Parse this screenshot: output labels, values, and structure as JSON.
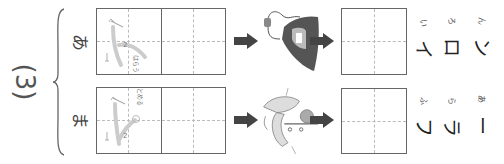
{
  "worksheet": {
    "number_label": "(3)",
    "rows": [
      {
        "start_kana": "あ",
        "trace_guides": {
          "stroke1": "1",
          "stroke2": "2",
          "hint": "はらう"
        },
        "picture": "iron-illustration",
        "answer_katakana": [
          "イ",
          "ロ",
          "ン"
        ],
        "answer_furigana": [
          "い",
          "ろ",
          "ん"
        ]
      },
      {
        "start_kana": "ま",
        "trace_guides": {
          "stroke1": "1",
          "stroke2": "2",
          "hint": "とめる"
        },
        "picture": "muffler-illustration",
        "answer_katakana": [
          "フ",
          "ラ",
          "ー"
        ],
        "answer_furigana": [
          "ふ",
          "ら",
          "あ"
        ]
      }
    ]
  },
  "colors": {
    "box_border": "#666666",
    "guide_dash": "#bbbbbb",
    "arrow": "#444444",
    "trace_gray": "#cccccc"
  }
}
